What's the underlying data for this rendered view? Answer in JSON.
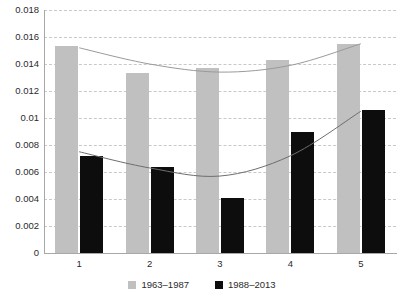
{
  "chart_data": {
    "type": "bar",
    "title": "",
    "xlabel": "",
    "ylabel": "",
    "categories": [
      "1",
      "2",
      "3",
      "4",
      "5"
    ],
    "ylim": [
      0,
      0.018
    ],
    "yticks": [
      0,
      0.002,
      0.004,
      0.006,
      0.008,
      0.01,
      0.012,
      0.014,
      0.016,
      0.018
    ],
    "ytick_labels": [
      "0",
      "0.002",
      "0.004",
      "0.006",
      "0.008",
      "0.01",
      "0.012",
      "0.014",
      "0.016",
      "0.018"
    ],
    "grid": true,
    "legend_position": "bottom",
    "series": [
      {
        "name": "1963–1987",
        "color": "#c0c0c0",
        "values": [
          0.0153,
          0.0133,
          0.0137,
          0.0143,
          0.0155
        ]
      },
      {
        "name": "1988–2013",
        "color": "#0d0d0d",
        "values": [
          0.0072,
          0.0064,
          0.0041,
          0.009,
          0.0106
        ]
      }
    ],
    "trendlines": [
      {
        "name": "1963–1987 trend",
        "color": "#9a9a9a",
        "x": [
          1,
          2,
          3,
          4,
          5
        ],
        "y": [
          0.0152,
          0.014,
          0.0134,
          0.0139,
          0.0155
        ]
      },
      {
        "name": "1988–2013 trend",
        "color": "#6e6e6e",
        "x": [
          1,
          2,
          3,
          4,
          5
        ],
        "y": [
          0.0075,
          0.0063,
          0.0057,
          0.0072,
          0.0105
        ]
      }
    ]
  },
  "legend": {
    "items": [
      {
        "label": "1963–1987",
        "color": "#c0c0c0"
      },
      {
        "label": "1988–2013",
        "color": "#0d0d0d"
      }
    ]
  }
}
